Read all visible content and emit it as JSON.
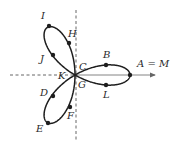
{
  "figure": {
    "curve": "three-leaf rose",
    "colors": {
      "curve": "#1e1e1e",
      "axis": "#555555",
      "background": "#ffffff"
    },
    "origin": {
      "x": 75,
      "y": 75
    },
    "petal_scale_px": 55,
    "points": [
      {
        "id": "A",
        "label": "A = M",
        "x": 130,
        "y": 75,
        "lx": 137,
        "ly": 67
      },
      {
        "id": "B",
        "label": "B",
        "x": 106,
        "y": 65,
        "lx": 103,
        "ly": 58
      },
      {
        "id": "C",
        "label": "C",
        "x": 75,
        "y": 75,
        "lx": 79,
        "ly": 70
      },
      {
        "id": "D",
        "label": "D",
        "x": 53,
        "y": 96,
        "lx": 40,
        "ly": 96
      },
      {
        "id": "E",
        "label": "E",
        "x": 48,
        "y": 123,
        "lx": 36,
        "ly": 132
      },
      {
        "id": "F",
        "label": "F",
        "x": 70,
        "y": 107,
        "lx": 67,
        "ly": 119
      },
      {
        "id": "G",
        "label": "G",
        "x": 75,
        "y": 75,
        "lx": 78,
        "ly": 88
      },
      {
        "id": "H",
        "label": "H",
        "x": 69,
        "y": 43,
        "lx": 68,
        "ly": 37
      },
      {
        "id": "I",
        "label": "I",
        "x": 49,
        "y": 26,
        "lx": 41,
        "ly": 19
      },
      {
        "id": "J",
        "label": "J",
        "x": 53,
        "y": 55,
        "lx": 40,
        "ly": 62
      },
      {
        "id": "K",
        "label": "K",
        "x": 75,
        "y": 75,
        "lx": 58,
        "ly": 79
      },
      {
        "id": "L",
        "label": "L",
        "x": 106,
        "y": 85,
        "lx": 103,
        "ly": 98
      }
    ],
    "axes": {
      "horizontal": {
        "x1": 10,
        "x2": 155,
        "y": 75,
        "dashed_until_x": 75,
        "arrow": true
      },
      "vertical": {
        "x": 76,
        "y1": 10,
        "y2": 140,
        "dashed": true
      }
    }
  }
}
